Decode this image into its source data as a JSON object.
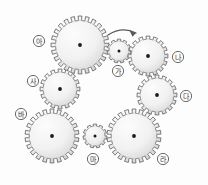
{
  "diagram": {
    "background_color": "#fdfdfd",
    "gear_fill_light": "#f6f6f6",
    "gear_fill_shade": "#c9c9c9",
    "gear_outline_color": "#6f6f6f",
    "hub_color": "#1a1a1a",
    "label_text_color": "#333333",
    "rotation_arrow": {
      "name": "rotation-direction-arrow",
      "direction": "clockwise",
      "near_gear": "가"
    },
    "gears": [
      {
        "id": "gear-a",
        "label": "아",
        "cx": 80,
        "cy": 45,
        "radius": 29,
        "teeth": 24,
        "size": "large",
        "label_cx": 39,
        "label_cy": 41
      },
      {
        "id": "gear-ga",
        "label": "가",
        "cx": 119,
        "cy": 51,
        "radius": 12,
        "teeth": 11,
        "size": "small",
        "label_cx": 118,
        "label_cy": 71
      },
      {
        "id": "gear-na",
        "label": "나",
        "cx": 148,
        "cy": 56,
        "radius": 20,
        "teeth": 16,
        "size": "medium",
        "label_cx": 178,
        "label_cy": 57
      },
      {
        "id": "gear-sa",
        "label": "사",
        "cx": 60,
        "cy": 89,
        "radius": 20,
        "teeth": 16,
        "size": "medium",
        "label_cx": 33,
        "label_cy": 81
      },
      {
        "id": "gear-da",
        "label": "다",
        "cx": 157,
        "cy": 95,
        "radius": 20,
        "teeth": 16,
        "size": "medium",
        "label_cx": 186,
        "label_cy": 96
      },
      {
        "id": "gear-ba",
        "label": "바",
        "cx": 52,
        "cy": 136,
        "radius": 27,
        "teeth": 22,
        "size": "large",
        "label_cx": 21,
        "label_cy": 114
      },
      {
        "id": "gear-ma",
        "label": "마",
        "cx": 95,
        "cy": 136,
        "radius": 12,
        "teeth": 11,
        "size": "small",
        "label_cx": 93,
        "label_cy": 159
      },
      {
        "id": "gear-ra",
        "label": "라",
        "cx": 134,
        "cy": 136,
        "radius": 27,
        "teeth": 22,
        "size": "large",
        "label_cx": 163,
        "label_cy": 159
      }
    ]
  }
}
